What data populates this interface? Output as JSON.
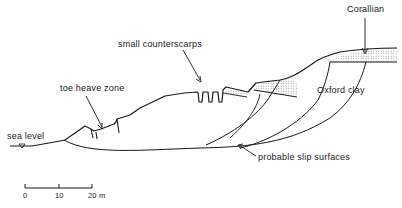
{
  "labels": {
    "corallian": "Corallian",
    "oxford_clay": "Oxford clay",
    "counterscarps": "small counterscarps",
    "toe_heave": "toe heave zone",
    "sea_level": "sea level",
    "slip_surfaces": "probable slip surfaces"
  },
  "scale_bar": {
    "ticks": [
      "0",
      "10",
      "20 m"
    ]
  },
  "colors": {
    "line": "#1a1a1a",
    "fill_pattern": "#9a9a9a",
    "background": "#ffffff"
  }
}
